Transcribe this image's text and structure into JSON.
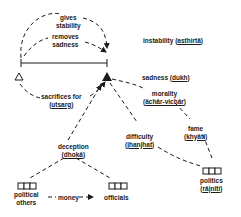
{
  "labels": {
    "gives": "gives",
    "stability": "stability",
    "removes": "removes",
    "sadness_top": "sadness",
    "instability": "instability (",
    "instability_term": "asthirtā",
    "instability_close": ")",
    "sadness": "sadness (",
    "sadness_term": "dukh",
    "sadness_close": ")",
    "morality": "morality",
    "morality_term": "āchār-vichār",
    "sacrifices": "sacrifices for",
    "sacrifices_term": "utsarg",
    "difficulty": "difficulty",
    "difficulty_term": "jhanjhat",
    "fame": "fame",
    "fame_term": "khyāti",
    "deception": "deception",
    "deception_term": "dhokā",
    "politics": "politics",
    "politics_term": "rājnīti",
    "political_others_1": "political",
    "political_others_2": "others",
    "money": "money",
    "officials": "officials"
  },
  "colors": {
    "ink": "#1a1a1a",
    "background": "#ffffff"
  }
}
